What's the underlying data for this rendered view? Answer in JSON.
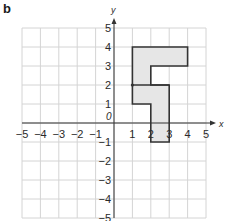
{
  "figure": {
    "part_label": "b",
    "x_axis_label": "x",
    "y_axis_label": "y",
    "origin_label": "0",
    "x_range": [
      -5,
      5
    ],
    "y_range": [
      -5,
      5
    ],
    "x_ticks": [
      "-5",
      "-4",
      "-3",
      "-2",
      "-1",
      "1",
      "2",
      "3",
      "4",
      "5"
    ],
    "y_ticks": [
      "5",
      "4",
      "3",
      "2",
      "1",
      "-1",
      "-2",
      "-3",
      "-4",
      "-5"
    ],
    "grid": true,
    "shape": {
      "fill": "#e6e6e6",
      "stroke": "#333333",
      "outline": [
        [
          1,
          4
        ],
        [
          4,
          4
        ],
        [
          4,
          3
        ],
        [
          2,
          3
        ],
        [
          2,
          2
        ],
        [
          3,
          2
        ],
        [
          3,
          -1
        ],
        [
          2,
          -1
        ],
        [
          2,
          1
        ],
        [
          1,
          1
        ],
        [
          1,
          4
        ]
      ],
      "divider": [
        [
          1,
          2
        ],
        [
          3,
          2
        ]
      ],
      "marked_point": [
        1,
        2
      ]
    }
  },
  "chart_data": {
    "type": "diagram",
    "title": "b",
    "xlabel": "x",
    "ylabel": "y",
    "xlim": [
      -5,
      5
    ],
    "ylim": [
      -5,
      5
    ],
    "grid": true,
    "shapes": [
      {
        "name": "upper piece",
        "vertices": [
          [
            1,
            2
          ],
          [
            1,
            4
          ],
          [
            4,
            4
          ],
          [
            4,
            3
          ],
          [
            2,
            3
          ],
          [
            2,
            2
          ]
        ]
      },
      {
        "name": "lower piece",
        "vertices": [
          [
            1,
            2
          ],
          [
            3,
            2
          ],
          [
            3,
            -1
          ],
          [
            2,
            -1
          ],
          [
            2,
            1
          ],
          [
            1,
            1
          ]
        ]
      }
    ],
    "points": [
      [
        1,
        2
      ]
    ]
  }
}
